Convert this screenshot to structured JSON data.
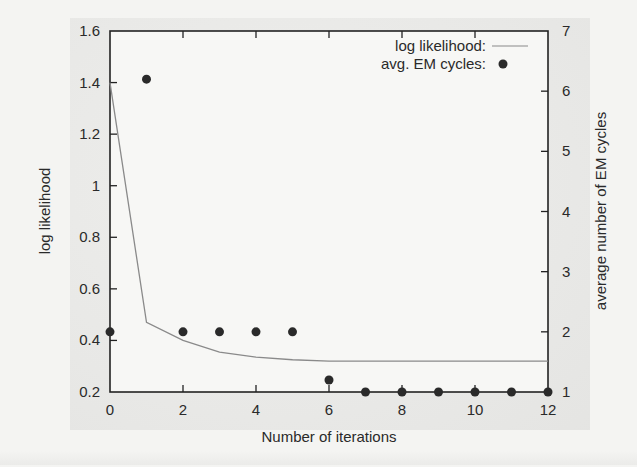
{
  "chart_data": {
    "type": "line+scatter",
    "title": "",
    "xlabel": "Number of iterations",
    "ylabel": "log likelihood",
    "y2label": "average number of EM cycles",
    "xlim": [
      0,
      12
    ],
    "ylim": [
      0.2,
      1.6
    ],
    "y2lim": [
      1,
      7
    ],
    "x_ticks": [
      0,
      2,
      4,
      6,
      8,
      10,
      12
    ],
    "y_ticks": [
      "0.2",
      "0.4",
      "0.6",
      "0.8",
      "1",
      "1.2",
      "1.4",
      "1.6"
    ],
    "y2_ticks": [
      "1",
      "2",
      "3",
      "4",
      "5",
      "6",
      "7"
    ],
    "grid": false,
    "legend_position": "top-right",
    "series": [
      {
        "name": "log likelihood:",
        "type": "line",
        "axis": "left",
        "color": "#8a8a8a",
        "x": [
          0,
          1,
          2,
          3,
          4,
          5,
          6,
          7,
          8,
          9,
          10,
          11,
          12
        ],
        "values": [
          1.4,
          0.47,
          0.4,
          0.355,
          0.335,
          0.325,
          0.32,
          0.32,
          0.32,
          0.32,
          0.32,
          0.32,
          0.32
        ]
      },
      {
        "name": "avg. EM cycles:",
        "type": "scatter",
        "axis": "right",
        "color": "#2a2a2a",
        "x": [
          0,
          1,
          2,
          3,
          4,
          5,
          6,
          7,
          8,
          9,
          10,
          11,
          12
        ],
        "values": [
          2.0,
          6.2,
          2.0,
          2.0,
          2.0,
          2.0,
          1.2,
          1.0,
          1.0,
          1.0,
          1.0,
          1.0,
          1.0
        ]
      }
    ]
  }
}
